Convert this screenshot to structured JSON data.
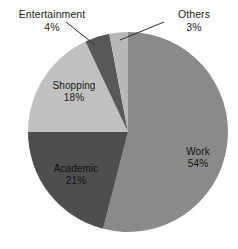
{
  "chart_data": {
    "type": "pie",
    "title": "",
    "subtitle": "",
    "legend": "none",
    "labels_position": "inside-and-callout",
    "categories": [
      "Work",
      "Academic",
      "Shopping",
      "Entertainment",
      "Others"
    ],
    "values": [
      54,
      21,
      18,
      4,
      3
    ],
    "value_suffix": "%",
    "total": 100,
    "start_angle_deg": 0,
    "direction": "clockwise",
    "slices": [
      {
        "name": "Work",
        "value": 54,
        "value_text": "54%",
        "color": "#8a8a8a",
        "label_placement": "inside",
        "label_color": "#111111",
        "start_deg": 0,
        "end_deg": 194.4
      },
      {
        "name": "Academic",
        "value": 21,
        "value_text": "21%",
        "color": "#4e4e4e",
        "label_placement": "inside",
        "label_color": "#111111",
        "start_deg": 194.4,
        "end_deg": 270.0
      },
      {
        "name": "Shopping",
        "value": 18,
        "value_text": "18%",
        "color": "#c0c0c0",
        "label_placement": "inside",
        "label_color": "#1a1a1a",
        "start_deg": 270.0,
        "end_deg": 334.8
      },
      {
        "name": "Entertainment",
        "value": 4,
        "value_text": "4%",
        "color": "#585858",
        "label_placement": "callout",
        "label_color": "#1a1a1a",
        "start_deg": 334.8,
        "end_deg": 349.2
      },
      {
        "name": "Others",
        "value": 3,
        "value_text": "3%",
        "color": "#b8b8b8",
        "label_placement": "callout",
        "label_color": "#1a1a1a",
        "start_deg": 349.2,
        "end_deg": 360.0
      }
    ],
    "geometry": {
      "center_x": 128,
      "center_y": 132,
      "radius": 100
    },
    "style": {
      "background": "#ffffff",
      "leader_line_color": "#2b2b2b",
      "slice_border_color": "#ffffff"
    }
  }
}
